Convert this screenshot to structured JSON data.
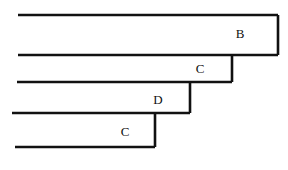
{
  "canvas": {
    "width": 288,
    "height": 170,
    "background": "#ffffff",
    "stroke_color": "#111111",
    "stroke_width": 2.6
  },
  "diagram": {
    "type": "terrace-step-diagram",
    "label_font_size": 13,
    "label_color": "#111111"
  },
  "chart_data": {
    "type": "diagram",
    "title": "",
    "bands": [
      {
        "id": "band-b",
        "label": "B",
        "label_x": 240,
        "label_y": 33,
        "top_y": 15,
        "bottom_y": 55,
        "left_x": 18,
        "right_x": 278
      },
      {
        "id": "band-c-upper",
        "label": "C",
        "label_x": 200,
        "label_y": 68,
        "top_y": 55,
        "bottom_y": 82,
        "left_x": 17,
        "right_x": 232
      },
      {
        "id": "band-d",
        "label": "D",
        "label_x": 158,
        "label_y": 99,
        "top_y": 82,
        "bottom_y": 113,
        "left_x": 12,
        "right_x": 190
      },
      {
        "id": "band-c-lower",
        "label": "C",
        "label_x": 125,
        "label_y": 131,
        "top_y": 113,
        "bottom_y": 147,
        "left_x": 15,
        "right_x": 155
      }
    ],
    "horizontal_lines": [
      {
        "id": "line-1",
        "y": 15,
        "x1": 18,
        "x2": 278
      },
      {
        "id": "line-2",
        "y": 55,
        "x1": 18,
        "x2": 278
      },
      {
        "id": "line-3",
        "y": 82,
        "x1": 17,
        "x2": 232
      },
      {
        "id": "line-4",
        "y": 113,
        "x1": 12,
        "x2": 190
      },
      {
        "id": "line-5",
        "y": 147,
        "x1": 15,
        "x2": 155
      }
    ],
    "vertical_lines": [
      {
        "id": "riser-b",
        "x": 278,
        "y1": 15,
        "y2": 55
      },
      {
        "id": "riser-c-upper",
        "x": 232,
        "y1": 55,
        "y2": 82
      },
      {
        "id": "riser-d",
        "x": 190,
        "y1": 82,
        "y2": 113
      },
      {
        "id": "riser-c-lower",
        "x": 155,
        "y1": 113,
        "y2": 147
      }
    ],
    "labels": [
      "B",
      "C",
      "D",
      "C"
    ]
  }
}
